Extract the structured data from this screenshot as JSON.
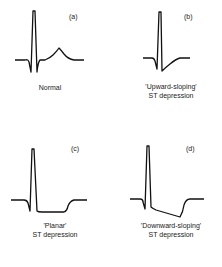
{
  "panels": [
    {
      "tag": "(a)",
      "caption_line1": "Normal",
      "caption_line2": ""
    },
    {
      "tag": "(b)",
      "caption_line1": "'Upward-sloping'",
      "caption_line2": "ST depression"
    },
    {
      "tag": "(c)",
      "caption_line1": "'Planar'",
      "caption_line2": "ST depression"
    },
    {
      "tag": "(d)",
      "caption_line1": "'Downward-sloping'",
      "caption_line2": "ST depression"
    }
  ],
  "colors": {
    "trace": "#111111",
    "text": "#222222",
    "background": "#ffffff"
  }
}
